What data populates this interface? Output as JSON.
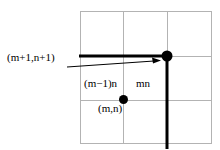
{
  "figure": {
    "labels": {
      "corner_point": "(m+1,n+1)",
      "left_cell": "(m−1)n",
      "right_cell": "mn",
      "origin_point": "(m,n)"
    },
    "colors": {
      "grid_line": "#b3b3b3",
      "emphasis_line": "#000000",
      "point_fill": "#000000",
      "leader_line": "#000000",
      "background": "#ffffff"
    },
    "geometry": {
      "grid": {
        "x_lines": [
          80,
          123.5,
          167,
          211.5
        ],
        "y_lines": [
          11,
          56,
          100,
          143
        ],
        "stroke_width": 1
      },
      "emphasis_horizontal": {
        "x1": 79,
        "x2": 168,
        "y": 56,
        "stroke_width": 3
      },
      "emphasis_vertical": {
        "x": 167,
        "y1": 56,
        "y2": 149,
        "stroke_width": 3
      },
      "points": [
        {
          "name": "corner-point",
          "cx": 167,
          "cy": 56,
          "r": 5.5
        },
        {
          "name": "origin-point",
          "cx": 123.5,
          "cy": 99.5,
          "r": 4.5
        }
      ],
      "leader": {
        "x1": 67,
        "y1": 67,
        "x2": 160,
        "y2": 60.5,
        "stroke_width": 1,
        "arrowhead_length": 7,
        "arrowhead_width": 5
      }
    }
  }
}
